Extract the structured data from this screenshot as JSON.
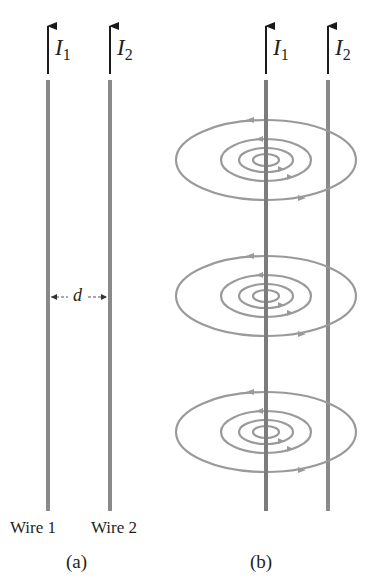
{
  "colors": {
    "wire": "#8a8a8a",
    "field_line": "#9a9a9a",
    "arrow": "#1a1a1a",
    "text": "#231f20",
    "background": "#ffffff"
  },
  "panel_a": {
    "label": "(a)",
    "wire1": {
      "name": "Wire 1",
      "current_symbol": "I",
      "current_subscript": "1",
      "current_direction": "up"
    },
    "wire2": {
      "name": "Wire 2",
      "current_symbol": "I",
      "current_subscript": "2",
      "current_direction": "up"
    },
    "separation": {
      "symbol": "d"
    }
  },
  "panel_b": {
    "label": "(b)",
    "wire1": {
      "current_symbol": "I",
      "current_subscript": "1",
      "current_direction": "up"
    },
    "wire2": {
      "current_symbol": "I",
      "current_subscript": "2",
      "current_direction": "up"
    },
    "field_loop_groups": 3,
    "loops_per_group": 4,
    "field_circulation": "counterclockwise (viewed from above)"
  }
}
